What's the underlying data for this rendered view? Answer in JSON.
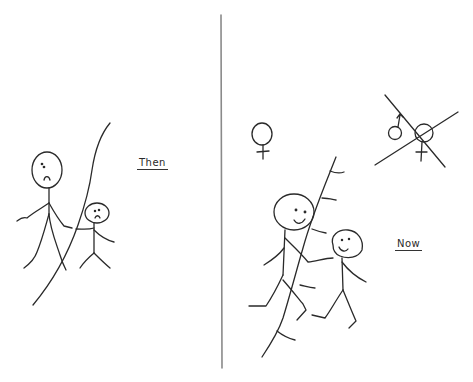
{
  "panels": {
    "left": {
      "label": "Then",
      "figures": [
        {
          "role": "adult",
          "expression": "sad"
        },
        {
          "role": "child",
          "expression": "sad"
        }
      ],
      "wall": "continuous line separating figures"
    },
    "right": {
      "label": "Now",
      "symbols": [
        {
          "name": "female-symbol",
          "glyph": "♀"
        },
        {
          "name": "crossed-out-male-female-symbol",
          "glyph": "♂♀ ✕"
        }
      ],
      "figures": [
        {
          "role": "adult",
          "expression": "happy"
        },
        {
          "role": "child",
          "expression": "happy"
        }
      ],
      "wall": "stitched line, figures holding hands across it"
    }
  },
  "colors": {
    "background": "#ffffff",
    "ink": "#2a2a2a",
    "divider": "#8a8a8a"
  }
}
